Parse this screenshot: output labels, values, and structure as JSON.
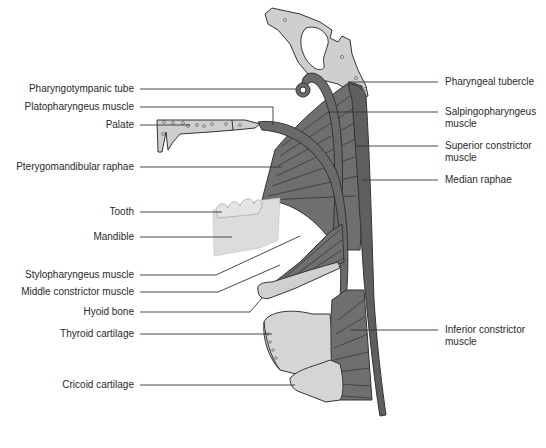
{
  "figure": {
    "colors": {
      "muscle": "#6f6f6f",
      "muscle_dark": "#4a4a4a",
      "bone": "#cfcfcf",
      "cartilage": "#d9d9d9",
      "leader_line": "#333333",
      "text": "#2a2a2a"
    }
  },
  "labels_left": [
    {
      "id": "pharyngotympanic-tube",
      "text": "Pharyngotympanic tube"
    },
    {
      "id": "platopharyngeus-muscle",
      "text": "Platopharyngeus muscle"
    },
    {
      "id": "palate",
      "text": "Palate"
    },
    {
      "id": "pterygomandibular-raphae",
      "text": "Pterygomandibular raphae"
    },
    {
      "id": "tooth",
      "text": "Tooth"
    },
    {
      "id": "mandible",
      "text": "Mandible"
    },
    {
      "id": "stylopharyngeus-muscle",
      "text": "Stylopharyngeus muscle"
    },
    {
      "id": "middle-constrictor-muscle",
      "text": "Middle constrictor muscle"
    },
    {
      "id": "hyoid-bone",
      "text": "Hyoid bone"
    },
    {
      "id": "thyroid-cartilage",
      "text": "Thyroid cartilage"
    },
    {
      "id": "cricoid-cartilage",
      "text": "Cricoid cartilage"
    }
  ],
  "labels_right": [
    {
      "id": "pharyngeal-tubercle",
      "text": "Pharyngeal tubercle"
    },
    {
      "id": "salpingopharyngeus-muscle",
      "text": "Salpingopharyngeus muscle"
    },
    {
      "id": "superior-constrictor-muscle",
      "text": "Superior constrictor muscle"
    },
    {
      "id": "median-raphae",
      "text": "Median raphae"
    },
    {
      "id": "inferior-constrictor-muscle",
      "text": "Inferior constrictor muscle"
    }
  ]
}
